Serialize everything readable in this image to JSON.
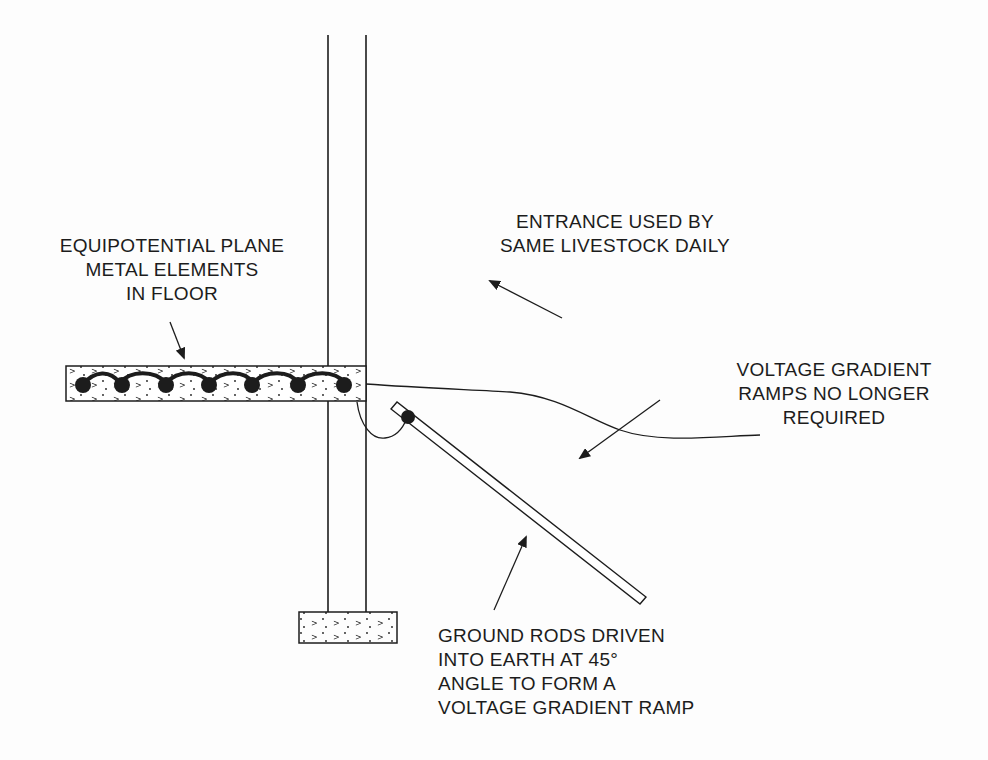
{
  "diagram": {
    "type": "cross-section",
    "colors": {
      "line": "#1c1c1c",
      "background": "#fdfdfd",
      "fill": "#1c1c1c"
    },
    "labels": {
      "equipotential": {
        "lines": [
          "EQUIPOTENTIAL PLANE",
          "METAL ELEMENTS",
          "IN FLOOR"
        ]
      },
      "entrance": {
        "lines": [
          "ENTRANCE USED BY",
          "SAME LIVESTOCK DAILY"
        ]
      },
      "ramps": {
        "lines": [
          "VOLTAGE GRADIENT",
          "RAMPS NO LONGER",
          "REQUIRED"
        ]
      },
      "ground_rods": {
        "lines": [
          "GROUND RODS DRIVEN",
          "INTO EARTH AT 45°",
          "ANGLE TO FORM A",
          "VOLTAGE GRADIENT RAMP"
        ]
      }
    },
    "elements": {
      "floor_slab": {
        "metal_elements_count": 7
      },
      "ground_rod_angle": "45°",
      "footing": "concrete footing"
    }
  }
}
